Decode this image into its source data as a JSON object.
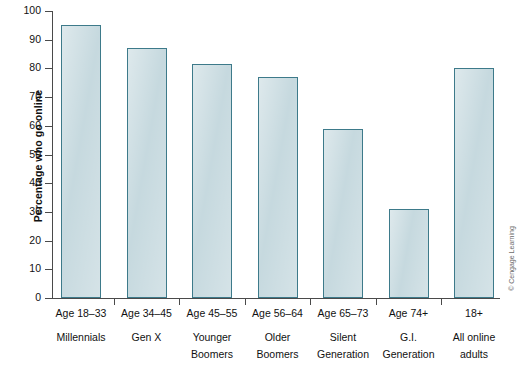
{
  "chart_data": {
    "type": "bar",
    "title": "",
    "xlabel": "",
    "ylabel": "Percentage who go online",
    "ylim": [
      0,
      100
    ],
    "yticks": [
      0,
      10,
      20,
      30,
      40,
      50,
      60,
      70,
      80,
      90,
      100
    ],
    "grid": false,
    "legend": null,
    "categories": [
      "Age 18–33 Millennials",
      "Age 34–45 Gen X",
      "Age 45–55 Younger Boomers",
      "Age 56–64 Older Boomers",
      "Age 65–73 Silent Generation",
      "Age 74+ G.I. Generation",
      "18+ All online adults"
    ],
    "values": [
      95,
      87,
      81.5,
      77,
      59,
      31,
      80
    ],
    "bar_color": "#c3d7dd",
    "bar_border_color": "#3d7a8a",
    "axis_color": "#4a4a4a"
  },
  "axis": {
    "y_title": "Percentage who go online",
    "y_tick_labels": [
      "100",
      "90",
      "80",
      "70",
      "60",
      "50",
      "40",
      "30",
      "20",
      "10",
      "0"
    ]
  },
  "bars": [
    {
      "age": "Age 18–33",
      "name_line1": "Millennials",
      "name_line2": "",
      "value": 95
    },
    {
      "age": "Age 34–45",
      "name_line1": "Gen X",
      "name_line2": "",
      "value": 87
    },
    {
      "age": "Age 45–55",
      "name_line1": "Younger",
      "name_line2": "Boomers",
      "value": 81.5
    },
    {
      "age": "Age 56–64",
      "name_line1": "Older",
      "name_line2": "Boomers",
      "value": 77
    },
    {
      "age": "Age 65–73",
      "name_line1": "Silent",
      "name_line2": "Generation",
      "value": 59
    },
    {
      "age": "Age 74+",
      "name_line1": "G.I.",
      "name_line2": "Generation",
      "value": 31
    },
    {
      "age": "18+",
      "name_line1": "All online",
      "name_line2": "adults",
      "value": 80
    }
  ],
  "credit": {
    "text": "© Cengage Learning"
  }
}
